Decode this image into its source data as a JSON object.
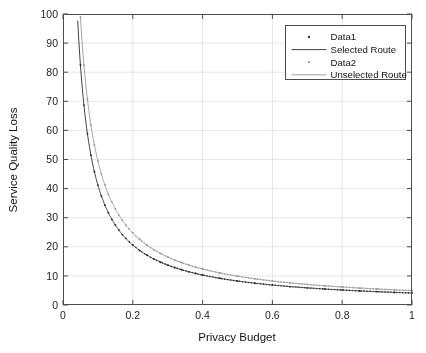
{
  "chart_data": {
    "type": "line",
    "title": "",
    "xlabel": "Privacy Budget",
    "ylabel": "Service Quality Loss",
    "xlim": [
      0,
      1
    ],
    "ylim": [
      0,
      100
    ],
    "xticks": [
      "0",
      "0.2",
      "0.4",
      "0.6",
      "0.8",
      "1"
    ],
    "xtick_values": [
      0,
      0.2,
      0.4,
      0.6,
      0.8,
      1
    ],
    "yticks": [
      "0",
      "10",
      "20",
      "30",
      "40",
      "50",
      "60",
      "70",
      "80",
      "90",
      "100"
    ],
    "ytick_values": [
      0,
      10,
      20,
      30,
      40,
      50,
      60,
      70,
      80,
      90,
      100
    ],
    "grid": true,
    "legend_position": "top-right",
    "legend": [
      {
        "label": "Data1",
        "style": "marker",
        "marker": "dot",
        "color": "#2b2b2b"
      },
      {
        "label": "Selected Route",
        "style": "line",
        "color": "#2b2b2b"
      },
      {
        "label": "Data2",
        "style": "marker",
        "marker": "dot",
        "color": "#9a9a9a"
      },
      {
        "label": "Unselected Route",
        "style": "line",
        "color": "#9a9a9a"
      }
    ],
    "series": [
      {
        "name": "Selected Route",
        "data_name": "Data1",
        "color": "#2b2b2b",
        "model": "k/epsilon",
        "k": 4.12,
        "x": [
          0.05,
          0.06,
          0.07,
          0.08,
          0.09,
          0.1,
          0.11,
          0.12,
          0.13,
          0.14,
          0.15,
          0.16,
          0.17,
          0.18,
          0.19,
          0.2,
          0.22,
          0.24,
          0.26,
          0.28,
          0.3,
          0.32,
          0.34,
          0.36,
          0.38,
          0.4,
          0.45,
          0.5,
          0.55,
          0.6,
          0.65,
          0.7,
          0.75,
          0.8,
          0.85,
          0.9,
          0.95,
          1.0
        ],
        "y": [
          82.5,
          68.7,
          58.9,
          51.5,
          45.8,
          41.2,
          37.5,
          34.3,
          31.7,
          29.4,
          27.5,
          25.8,
          24.2,
          22.9,
          21.7,
          20.6,
          18.7,
          17.2,
          15.8,
          14.7,
          13.7,
          12.9,
          12.1,
          11.4,
          10.8,
          10.3,
          9.2,
          8.2,
          7.5,
          6.9,
          6.3,
          5.9,
          5.5,
          5.2,
          4.8,
          4.6,
          4.3,
          4.1
        ]
      },
      {
        "name": "Unselected Route",
        "data_name": "Data2",
        "color": "#9a9a9a",
        "model": "k/epsilon",
        "k": 4.95,
        "x": [
          0.05,
          0.06,
          0.07,
          0.08,
          0.09,
          0.1,
          0.11,
          0.12,
          0.13,
          0.14,
          0.15,
          0.16,
          0.17,
          0.18,
          0.19,
          0.2,
          0.22,
          0.24,
          0.26,
          0.28,
          0.3,
          0.32,
          0.34,
          0.36,
          0.38,
          0.4,
          0.45,
          0.5,
          0.55,
          0.6,
          0.65,
          0.7,
          0.75,
          0.8,
          0.85,
          0.9,
          0.95,
          1.0
        ],
        "y": [
          99.0,
          82.5,
          70.7,
          61.9,
          55.0,
          49.5,
          45.0,
          41.3,
          38.1,
          35.4,
          33.0,
          30.9,
          29.1,
          27.5,
          26.1,
          24.8,
          22.5,
          20.6,
          19.0,
          17.7,
          16.5,
          15.5,
          14.6,
          13.8,
          13.0,
          12.4,
          11.0,
          9.9,
          9.0,
          8.3,
          7.6,
          7.1,
          6.6,
          6.2,
          5.8,
          5.5,
          5.2,
          4.9
        ]
      }
    ],
    "annotations": {
      "first_point_data1": "82.5 at 0.05",
      "first_point_data2": "clipped at 100"
    }
  },
  "colors": {
    "axis": "#4d4d4d",
    "grid": "#d9d9d9",
    "series_selected": "#2b2b2b",
    "series_unselected": "#9a9a9a",
    "background": "#ffffff",
    "text": "#141414"
  }
}
